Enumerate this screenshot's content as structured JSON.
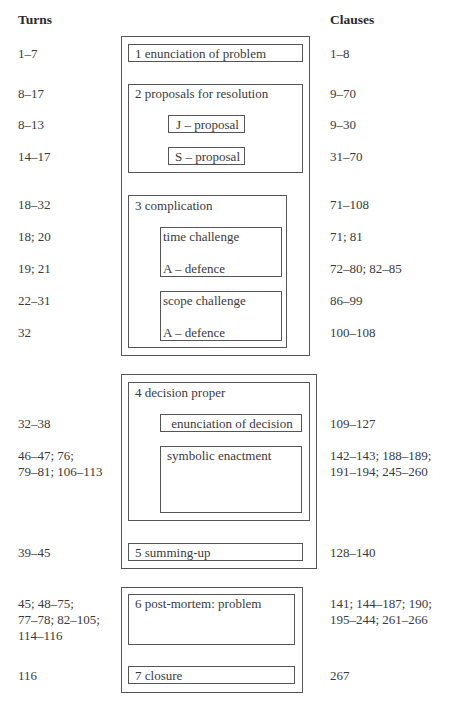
{
  "headers": {
    "turns": "Turns",
    "clauses": "Clauses"
  },
  "outer_groups": [
    "group-1-3",
    "group-4-5",
    "group-6-7"
  ],
  "stages": {
    "s1": {
      "label": "1  enunciation of problem",
      "turns": "1–7",
      "clauses": "1–8"
    },
    "s2": {
      "label": "2  proposals for resolution",
      "turns": "8–17",
      "clauses": "9–70",
      "j": {
        "label": "J – proposal",
        "turns": "8–13",
        "clauses": "9–30"
      },
      "s": {
        "label": "S – proposal",
        "turns": "14–17",
        "clauses": "31–70"
      }
    },
    "s3": {
      "label": "3  complication",
      "turns": "18–32",
      "clauses": "71–108",
      "time": {
        "label": "time challenge",
        "turns": "18; 20",
        "clauses": "71; 81"
      },
      "time_def": {
        "label": "A – defence",
        "turns": "19; 21",
        "clauses": "72–80; 82–85"
      },
      "scope": {
        "label": "scope challenge",
        "turns": "22–31",
        "clauses": "86–99"
      },
      "scope_def": {
        "label": "A – defence",
        "turns": "32",
        "clauses": "100–108"
      }
    },
    "s4": {
      "label": "4  decision proper",
      "enun": {
        "label": "enunciation of decision",
        "turns": "32–38",
        "clauses": "109–127"
      },
      "symb": {
        "label": "symbolic enactment",
        "turns_l1": "46–47; 76;",
        "turns_l2": "79–81; 106–113",
        "clauses_l1": "142–143; 188–189;",
        "clauses_l2": "191–194; 245–260"
      }
    },
    "s5": {
      "label": "5  summing-up",
      "turns": "39–45",
      "clauses": "128–140"
    },
    "s6": {
      "label": "6  post-mortem: problem",
      "turns_l1": "45; 48–75;",
      "turns_l2": "77–78; 82–105;",
      "turns_l3": "114–116",
      "clauses_l1": "141; 144–187; 190;",
      "clauses_l2": "195–244; 261–266"
    },
    "s7": {
      "label": "7  closure",
      "turns": "116",
      "clauses": "267"
    }
  }
}
